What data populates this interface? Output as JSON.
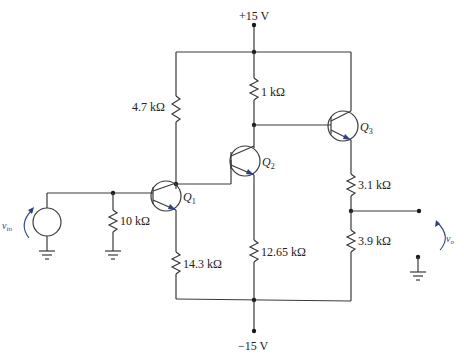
{
  "diagram": {
    "type": "three-stage BJT amplifier schematic",
    "supplies": {
      "positive": "+15 V",
      "negative": "−15 V"
    },
    "transistors": [
      {
        "id": "Q1",
        "label": "Q",
        "subscript": "1"
      },
      {
        "id": "Q2",
        "label": "Q",
        "subscript": "2"
      },
      {
        "id": "Q3",
        "label": "Q",
        "subscript": "3"
      }
    ],
    "resistors": {
      "r_q1_collector": "4.7 kΩ",
      "r_q2_collector": "1 kΩ",
      "r_input_bias": "10 kΩ",
      "r_q1_emitter": "14.3 kΩ",
      "r_q2_emitter": "12.65 kΩ",
      "r_q3_emitter_top": "3.1 kΩ",
      "r_q3_emitter_bottom": "3.9 kΩ"
    },
    "signals": {
      "input": {
        "label": "v",
        "subscript": "in"
      },
      "output": {
        "label": "v",
        "subscript": "o"
      }
    },
    "colors": {
      "wire": "#3a3a3a",
      "signal_annotation": "#2c3f8c"
    }
  }
}
